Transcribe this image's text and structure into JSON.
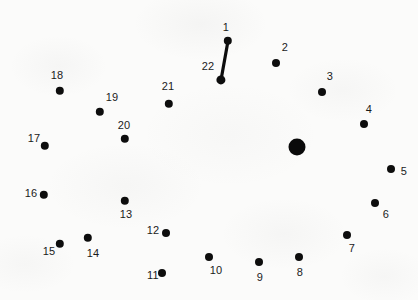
{
  "puzzle": {
    "kind": "connect-the-dots",
    "background_color": "#fbfbfa",
    "dot_color": "#0d0d0d",
    "label_color": "#1a1a1a",
    "width": 418,
    "height": 300,
    "dot_count": 22,
    "dots": [
      {
        "label": "1",
        "x": 228,
        "y": 41,
        "r": 4.2,
        "lx": 226,
        "ly": 27
      },
      {
        "label": "2",
        "x": 276,
        "y": 63,
        "r": 4.0,
        "lx": 285,
        "ly": 47
      },
      {
        "label": "3",
        "x": 322,
        "y": 92,
        "r": 4.0,
        "lx": 330,
        "ly": 76
      },
      {
        "label": "4",
        "x": 364,
        "y": 124,
        "r": 4.0,
        "lx": 369,
        "ly": 109
      },
      {
        "label": "5",
        "x": 391,
        "y": 169,
        "r": 4.0,
        "lx": 404,
        "ly": 171
      },
      {
        "label": "6",
        "x": 375,
        "y": 203,
        "r": 4.0,
        "lx": 386,
        "ly": 214
      },
      {
        "label": "7",
        "x": 347,
        "y": 235,
        "r": 4.0,
        "lx": 352,
        "ly": 248
      },
      {
        "label": "8",
        "x": 299,
        "y": 257,
        "r": 4.0,
        "lx": 300,
        "ly": 272
      },
      {
        "label": "9",
        "x": 259,
        "y": 262,
        "r": 4.0,
        "lx": 260,
        "ly": 277
      },
      {
        "label": "10",
        "x": 209,
        "y": 257,
        "r": 4.0,
        "lx": 216,
        "ly": 270
      },
      {
        "label": "11",
        "x": 162,
        "y": 273,
        "r": 4.0,
        "lx": 153,
        "ly": 275
      },
      {
        "label": "12",
        "x": 166,
        "y": 233,
        "r": 4.0,
        "lx": 153,
        "ly": 230
      },
      {
        "label": "13",
        "x": 125,
        "y": 201,
        "r": 4.2,
        "lx": 126,
        "ly": 214
      },
      {
        "label": "14",
        "x": 88,
        "y": 238,
        "r": 4.2,
        "lx": 93,
        "ly": 253
      },
      {
        "label": "15",
        "x": 60,
        "y": 244,
        "r": 4.2,
        "lx": 49,
        "ly": 251
      },
      {
        "label": "16",
        "x": 44,
        "y": 195,
        "r": 4.2,
        "lx": 31,
        "ly": 193
      },
      {
        "label": "17",
        "x": 45,
        "y": 146,
        "r": 4.2,
        "lx": 34,
        "ly": 138
      },
      {
        "label": "18",
        "x": 60,
        "y": 91,
        "r": 4.2,
        "lx": 57,
        "ly": 75
      },
      {
        "label": "19",
        "x": 100,
        "y": 112,
        "r": 4.2,
        "lx": 112,
        "ly": 97
      },
      {
        "label": "20",
        "x": 125,
        "y": 139,
        "r": 4.2,
        "lx": 124,
        "ly": 125
      },
      {
        "label": "21",
        "x": 169,
        "y": 104,
        "r": 4.2,
        "lx": 168,
        "ly": 86
      },
      {
        "label": "22",
        "x": 221,
        "y": 80,
        "r": 4.6,
        "lx": 208,
        "ly": 66
      }
    ],
    "big_dot": {
      "x": 297,
      "y": 147,
      "r": 8.5
    },
    "segments": [
      {
        "from": "1",
        "to": "22",
        "x1": 228,
        "y1": 41,
        "x2": 221,
        "y2": 80,
        "width": 3.2
      }
    ]
  }
}
